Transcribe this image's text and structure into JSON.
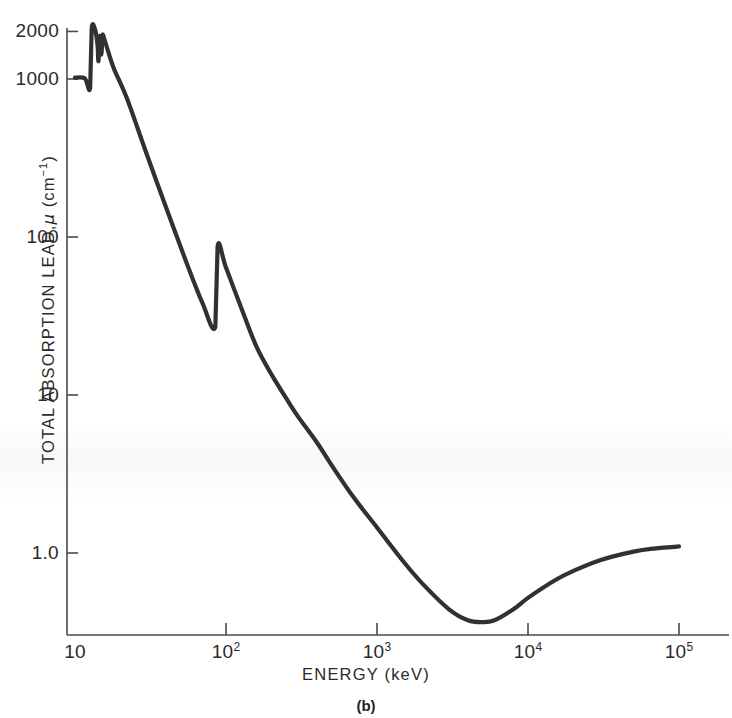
{
  "figure": {
    "caption": "(b)",
    "x_axis_title": "ENERGY (keV)",
    "y_axis_title_prefix": "TOTAL ABSORPTION LEAD,",
    "y_axis_title_symbol": "μ",
    "y_axis_title_unit_open": "(cm",
    "y_axis_title_unit_exp": "−1",
    "y_axis_title_unit_close": ")",
    "curve_color": "#32312f",
    "axis_color": "#4a4a4a",
    "background_color": "#ffffff"
  },
  "y_ticks": [
    {
      "label": "2000",
      "value": 2000
    },
    {
      "label": "1000",
      "value": 1000
    },
    {
      "label": "100",
      "value": 100
    },
    {
      "label": "10",
      "value": 10
    },
    {
      "label": "1.0",
      "value": 1.0
    }
  ],
  "x_ticks": [
    {
      "label": "10",
      "base": "10",
      "exp": "",
      "value": 10
    },
    {
      "label": "10^2",
      "base": "10",
      "exp": "2",
      "value": 100
    },
    {
      "label": "10^3",
      "base": "10",
      "exp": "3",
      "value": 1000
    },
    {
      "label": "10^4",
      "base": "10",
      "exp": "4",
      "value": 10000
    },
    {
      "label": "10^5",
      "base": "10",
      "exp": "5",
      "value": 100000
    }
  ],
  "chart_data": {
    "type": "line",
    "title": "",
    "subtitle": "",
    "caption": "(b)",
    "xlabel": "ENERGY (keV)",
    "ylabel": "TOTAL ABSORPTION LEAD, μ (cm⁻¹)",
    "xscale": "log",
    "yscale": "log",
    "xlim": [
      10,
      100000
    ],
    "ylim": [
      0.3,
      2400
    ],
    "grid": false,
    "legend": null,
    "annotations": [],
    "series": [
      {
        "name": "Total absorption coefficient, lead",
        "color": "#32312f",
        "points": [
          {
            "x": 10.0,
            "y": 1020
          },
          {
            "x": 11.6,
            "y": 1010
          },
          {
            "x": 12.6,
            "y": 880
          },
          {
            "x": 12.9,
            "y": 2080
          },
          {
            "x": 13.6,
            "y": 2050
          },
          {
            "x": 14.1,
            "y": 1640
          },
          {
            "x": 14.3,
            "y": 1300
          },
          {
            "x": 14.6,
            "y": 1870
          },
          {
            "x": 15.0,
            "y": 1430
          },
          {
            "x": 15.2,
            "y": 1900
          },
          {
            "x": 15.9,
            "y": 1700
          },
          {
            "x": 18.0,
            "y": 1180
          },
          {
            "x": 22.0,
            "y": 760
          },
          {
            "x": 30.0,
            "y": 330
          },
          {
            "x": 40.0,
            "y": 155
          },
          {
            "x": 55.0,
            "y": 68
          },
          {
            "x": 70.0,
            "y": 38
          },
          {
            "x": 85.0,
            "y": 27
          },
          {
            "x": 88.0,
            "y": 88
          },
          {
            "x": 100.0,
            "y": 64
          },
          {
            "x": 130.0,
            "y": 33
          },
          {
            "x": 160.0,
            "y": 20
          },
          {
            "x": 200.0,
            "y": 13.5
          },
          {
            "x": 260.0,
            "y": 9.0
          },
          {
            "x": 300.0,
            "y": 7.3
          },
          {
            "x": 400.0,
            "y": 5.0
          },
          {
            "x": 500.0,
            "y": 3.6
          },
          {
            "x": 700.0,
            "y": 2.25
          },
          {
            "x": 1000.0,
            "y": 1.45
          },
          {
            "x": 1500.0,
            "y": 0.88
          },
          {
            "x": 2000.0,
            "y": 0.64
          },
          {
            "x": 3000.0,
            "y": 0.44
          },
          {
            "x": 4000.0,
            "y": 0.375
          },
          {
            "x": 5000.0,
            "y": 0.365
          },
          {
            "x": 6000.0,
            "y": 0.375
          },
          {
            "x": 8000.0,
            "y": 0.44
          },
          {
            "x": 10000.0,
            "y": 0.52
          },
          {
            "x": 15000.0,
            "y": 0.67
          },
          {
            "x": 20000.0,
            "y": 0.77
          },
          {
            "x": 30000.0,
            "y": 0.9
          },
          {
            "x": 50000.0,
            "y": 1.02
          },
          {
            "x": 70000.0,
            "y": 1.07
          },
          {
            "x": 100000.0,
            "y": 1.1
          }
        ]
      }
    ]
  }
}
